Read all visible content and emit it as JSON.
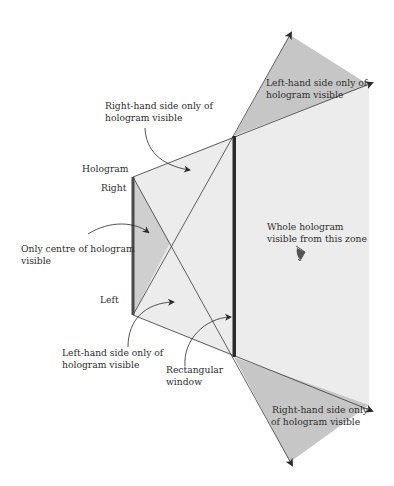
{
  "diagram": {
    "type": "hologram viewing zones through a rectangular window",
    "colors": {
      "background": "#ffffff",
      "light_zone": "#ececec",
      "dark_zone": "#c6c6c6",
      "centre_zone": "#cfcfcf",
      "line": "#3a3a3a",
      "hologram_bar": "#4a4a4a",
      "window_bar": "#2a2a2a",
      "eye": "#555555"
    },
    "labels": {
      "hologram": "Hologram",
      "right": "Right",
      "left": "Left",
      "only_centre_1": "Only centre of hologram",
      "only_centre_2": "visible",
      "rhs_upper_1": "Right-hand side only of",
      "rhs_upper_2": "hologram visible",
      "lhs_lower_1": "Left-hand side only of",
      "lhs_lower_2": "hologram visible",
      "window_1": "Rectangular",
      "window_2": "window",
      "whole_1": "Whole hologram",
      "whole_2": "visible from this zone",
      "lhs_top_zone_1": "Left-hand side only of",
      "lhs_top_zone_2": "hologram visible",
      "rhs_bottom_zone_1": "Right-hand side only",
      "rhs_bottom_zone_2": "of hologram visible"
    },
    "icons": {
      "eye": "eye-icon"
    }
  }
}
